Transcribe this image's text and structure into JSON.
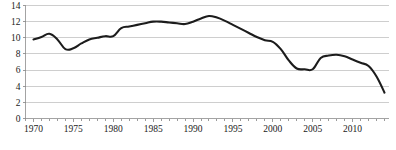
{
  "figure": {
    "background_color": "#ffffff",
    "line_color": "#1c1c1c",
    "gridline_color": "#b9b9b9",
    "axis_color": "#8c8c8c",
    "bottom_artifact_text": ""
  },
  "chart_data": {
    "type": "line",
    "title": "",
    "subtitle": "",
    "xlabel": "",
    "ylabel": "",
    "xlim": [
      1969,
      2014.5
    ],
    "ylim": [
      0,
      14
    ],
    "grid": true,
    "legend": false,
    "legend_position": "none",
    "y_ticks": [
      0,
      2,
      4,
      6,
      8,
      10,
      12,
      14
    ],
    "y_tick_labels": [
      "0",
      "2",
      "4",
      "6",
      "8",
      "10",
      "12",
      "14"
    ],
    "x_ticks": [
      1970,
      1975,
      1980,
      1985,
      1990,
      1995,
      2000,
      2005,
      2010
    ],
    "x_tick_labels": [
      "1970",
      "1975",
      "1980",
      "1985",
      "1990",
      "1995",
      "2000",
      "2005",
      "2010"
    ],
    "x_minor_tick_step": 1,
    "series": [
      {
        "name": "series-1",
        "color": "#1c1c1c",
        "x": [
          1970,
          1971,
          1972,
          1973,
          1974,
          1975,
          1976,
          1977,
          1978,
          1979,
          1980,
          1981,
          1982,
          1983,
          1984,
          1985,
          1986,
          1987,
          1988,
          1989,
          1990,
          1991,
          1992,
          1993,
          1994,
          1995,
          1996,
          1997,
          1998,
          1999,
          2000,
          2001,
          2002,
          2003,
          2004,
          2005,
          2006,
          2007,
          2008,
          2009,
          2010,
          2011,
          2012,
          2013,
          2014
        ],
        "values": [
          9.8,
          10.1,
          10.5,
          9.8,
          8.6,
          8.7,
          9.3,
          9.8,
          10.0,
          10.2,
          10.2,
          11.2,
          11.4,
          11.6,
          11.8,
          12.0,
          12.0,
          11.9,
          11.8,
          11.7,
          12.0,
          12.4,
          12.7,
          12.5,
          12.1,
          11.6,
          11.1,
          10.6,
          10.1,
          9.7,
          9.5,
          8.6,
          7.2,
          6.2,
          6.1,
          6.1,
          7.5,
          7.8,
          7.9,
          7.7,
          7.3,
          6.9,
          6.5,
          5.2,
          3.2
        ]
      }
    ]
  }
}
